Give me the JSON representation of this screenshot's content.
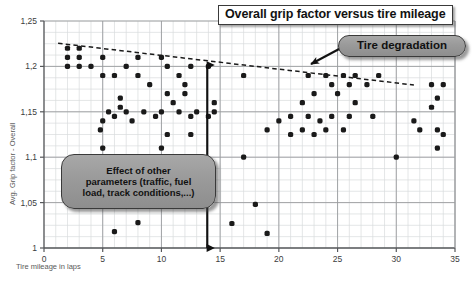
{
  "title": "Overall grip factor versus tire mileage",
  "annotations": {
    "degradation": "Tire degradation",
    "parameters_line1": "Effect of other",
    "parameters_line2": "parameters (traffic, fuel",
    "parameters_line3": "load, track conditions,...)"
  },
  "chart_data": {
    "type": "scatter",
    "title": "Overall grip factor versus tire mileage",
    "xlabel": "Tire mileage in laps",
    "ylabel": "Avg. Grip factor - Overall",
    "xlim": [
      0,
      35
    ],
    "ylim": [
      1,
      1.25
    ],
    "xticks": [
      "0",
      "5",
      "10",
      "15",
      "20",
      "25",
      "30",
      "35"
    ],
    "xtick_values": [
      0,
      5,
      10,
      15,
      20,
      25,
      30,
      35
    ],
    "yticks": [
      "1",
      "1,05",
      "1,1",
      "1,15",
      "1,2",
      "1,25"
    ],
    "ytick_values": [
      1,
      1.05,
      1.1,
      1.15,
      1.2,
      1.25
    ],
    "grid": true,
    "grid_minor_x": 1,
    "grid_minor_y": 0.0125,
    "legend": "none",
    "marker_color": "#1a1a1a",
    "marker_size": 4,
    "series": [
      {
        "name": "Avg. grip factor per lap",
        "points": [
          [
            2,
            1.22
          ],
          [
            3,
            1.22
          ],
          [
            2,
            1.21
          ],
          [
            3,
            1.21
          ],
          [
            5,
            1.21
          ],
          [
            8,
            1.21
          ],
          [
            10,
            1.21
          ],
          [
            2,
            1.2
          ],
          [
            3,
            1.2
          ],
          [
            4,
            1.2
          ],
          [
            7,
            1.2
          ],
          [
            10.5,
            1.2
          ],
          [
            12.5,
            1.2
          ],
          [
            14,
            1.2
          ],
          [
            5,
            1.19
          ],
          [
            6,
            1.19
          ],
          [
            8,
            1.19
          ],
          [
            11.5,
            1.19
          ],
          [
            17,
            1.19
          ],
          [
            22.5,
            1.19
          ],
          [
            24,
            1.19
          ],
          [
            25.5,
            1.19
          ],
          [
            26.5,
            1.19
          ],
          [
            28.5,
            1.19
          ],
          [
            9,
            1.18
          ],
          [
            12,
            1.18
          ],
          [
            24.5,
            1.18
          ],
          [
            26,
            1.18
          ],
          [
            27.5,
            1.18
          ],
          [
            33,
            1.18
          ],
          [
            34,
            1.18
          ],
          [
            10.5,
            1.17
          ],
          [
            12,
            1.17
          ],
          [
            23,
            1.17
          ],
          [
            25,
            1.17
          ],
          [
            6.5,
            1.165
          ],
          [
            33.5,
            1.165
          ],
          [
            11,
            1.16
          ],
          [
            14.5,
            1.16
          ],
          [
            22,
            1.16
          ],
          [
            26.5,
            1.16
          ],
          [
            6.5,
            1.155
          ],
          [
            33,
            1.155
          ],
          [
            5.5,
            1.15
          ],
          [
            7,
            1.15
          ],
          [
            8.5,
            1.15
          ],
          [
            10,
            1.15
          ],
          [
            11.5,
            1.15
          ],
          [
            13,
            1.15
          ],
          [
            14.5,
            1.15
          ],
          [
            6,
            1.145
          ],
          [
            9.5,
            1.145
          ],
          [
            12.5,
            1.145
          ],
          [
            14,
            1.145
          ],
          [
            21,
            1.145
          ],
          [
            22.5,
            1.145
          ],
          [
            24.5,
            1.145
          ],
          [
            26,
            1.145
          ],
          [
            28,
            1.145
          ],
          [
            5,
            1.14
          ],
          [
            7.5,
            1.14
          ],
          [
            20,
            1.14
          ],
          [
            23.5,
            1.14
          ],
          [
            31.5,
            1.14
          ],
          [
            4.8,
            1.13
          ],
          [
            19,
            1.13
          ],
          [
            22,
            1.13
          ],
          [
            24,
            1.13
          ],
          [
            25.5,
            1.13
          ],
          [
            32,
            1.13
          ],
          [
            33.5,
            1.13
          ],
          [
            10.5,
            1.125
          ],
          [
            12.5,
            1.125
          ],
          [
            21,
            1.125
          ],
          [
            23,
            1.125
          ],
          [
            34,
            1.125
          ],
          [
            5,
            1.11
          ],
          [
            10,
            1.11
          ],
          [
            33.5,
            1.11
          ],
          [
            4.2,
            1.1
          ],
          [
            17,
            1.1
          ],
          [
            30,
            1.1
          ],
          [
            18,
            1.048
          ],
          [
            8,
            1.028
          ],
          [
            16,
            1.027
          ],
          [
            6,
            1.018
          ],
          [
            19,
            1.016
          ]
        ]
      }
    ],
    "trendline": {
      "name": "Linear trend (tire degradation)",
      "style": "dashed",
      "color": "#1a1a1a",
      "x_start": 1.2,
      "y_start": 1.2255,
      "x_end": 31.5,
      "y_end": 1.1795
    },
    "markers": {
      "vertical_double_arrow": {
        "label": "Effect of other parameters",
        "x": 13.9,
        "y_top": 1.2015,
        "y_bottom": 1.0
      }
    }
  }
}
